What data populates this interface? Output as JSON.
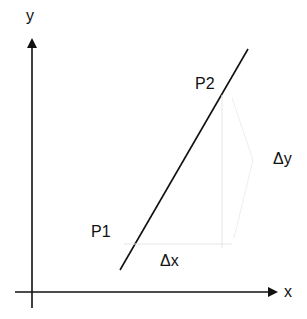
{
  "diagram": {
    "type": "slope-diagram",
    "axes": {
      "x_label": "x",
      "y_label": "y"
    },
    "points": {
      "p1_label": "P1",
      "p2_label": "P2"
    },
    "deltas": {
      "dx_label": "Δx",
      "dy_label": "Δy"
    },
    "colors": {
      "line": "#111111",
      "guide": "#e6e6e6",
      "background": "#ffffff"
    }
  }
}
